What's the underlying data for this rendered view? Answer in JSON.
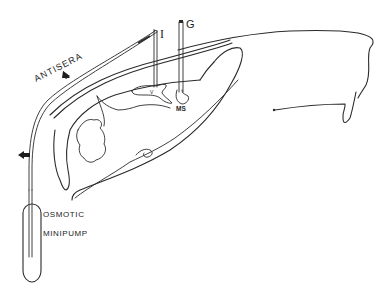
{
  "diagram": {
    "type": "anatomical line drawing",
    "labels": {
      "antisera": "ANTISERA",
      "cannula_i": "I",
      "cannula_g": "G",
      "ventricle": "V",
      "medial_septum": "MS",
      "pump_line1": "OSMOTIC",
      "pump_line2": "MINIPUMP"
    },
    "arrows": [
      {
        "name": "antisera-flow-arrow",
        "direction": "down-right"
      },
      {
        "name": "tubing-arrow",
        "direction": "left"
      }
    ],
    "colors": {
      "line": "#2a2a2a",
      "background": "#ffffff"
    }
  }
}
